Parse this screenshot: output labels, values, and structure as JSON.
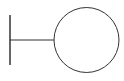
{
  "diagram": {
    "type": "uml-boundary-symbol",
    "colors": {
      "stroke": "#333333",
      "fill": "#ffffff",
      "background": "#ffffff"
    },
    "elements": {
      "vertical_bar": {
        "x": 10,
        "y1": 15,
        "y2": 65,
        "stroke_width": 1.5
      },
      "connector": {
        "x1": 10,
        "x2": 54,
        "y": 40,
        "stroke_width": 1
      },
      "circle": {
        "cx": 86.5,
        "cy": 40,
        "r": 32.5,
        "stroke_width": 1
      }
    }
  }
}
